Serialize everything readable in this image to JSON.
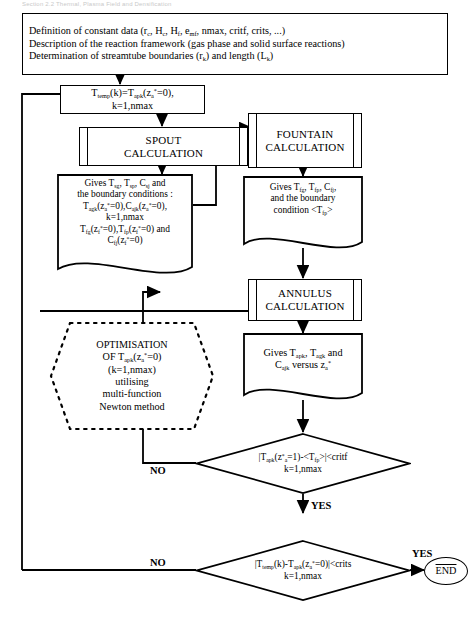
{
  "page": {
    "scan_header": "Section 2.2 Thermal, Plasma Field and Densification",
    "background": "#ffffff",
    "line_color": "#000000"
  },
  "start_box": {
    "lines": [
      "Definition of constant data (r c, H c, H f, e mf, nmax, critf, crits, ...)",
      "Description of the reaction framework (gas phase and solid surface reactions)",
      "Determination of streamtube boundaries (r k) and length (L k)"
    ],
    "line1_a": "Definition of constant data (r",
    "line1_sub1": "c",
    "line1_b": ", H",
    "line1_sub2": "c",
    "line1_c": ", H",
    "line1_sub3": "f",
    "line1_d": ", e",
    "line1_sub4": "mf",
    "line1_e": ", nmax, critf, crits, ...)",
    "line2": "Description of the reaction framework (gas phase and solid surface reactions)",
    "line3_a": "Determination of streamtube boundaries (r",
    "line3_sub1": "k",
    "line3_b": ") and length (L",
    "line3_sub2": "k",
    "line3_c": ")"
  },
  "init_box": {
    "l1_a": "T",
    "l1_sub1": "temp",
    "l1_b": "(k)=T",
    "l1_sub2": "apk",
    "l1_c": "(z",
    "l1_sub3": "a",
    "l1_sup": "*",
    "l1_d": "=0),",
    "l2": "k=1,nmax"
  },
  "spout_proc": {
    "line1": "SPOUT",
    "line2": "CALCULATION"
  },
  "fountain_proc": {
    "line1": "FOUNTAIN",
    "line2": "CALCULATION"
  },
  "annulus_proc": {
    "line1": "ANNULUS",
    "line2": "CALCULATION"
  },
  "spout_out": {
    "l1_a": "Gives T",
    "l1_s1": "sg",
    "l1_b": ", T",
    "l1_s2": "sp",
    "l1_c": ", C",
    "l1_s3": "sj",
    "l1_d": " and",
    "l2": "the boundary conditions :",
    "l3_a": "T",
    "l3_s1": "agk",
    "l3_b": "(z",
    "l3_s2": "a",
    "l3_sup1": "*",
    "l3_c": "=0),C",
    "l3_s3": "ajk",
    "l3_d": "(z",
    "l3_s4": "a",
    "l3_sup2": "*",
    "l3_e": "=0),",
    "l4": "k=1,nmax",
    "l5_a": "T",
    "l5_s1": "fg",
    "l5_b": "(z",
    "l5_s2": "f",
    "l5_sup1": "*",
    "l5_c": "=0),T",
    "l5_s3": "fp",
    "l5_d": "(z",
    "l5_s4": "f",
    "l5_sup2": "*",
    "l5_e": "=0) and",
    "l6_a": "C",
    "l6_s1": "fj",
    "l6_b": "(z",
    "l6_s2": "f",
    "l6_sup": "*",
    "l6_c": "=0)"
  },
  "fountain_out": {
    "l1_a": "Gives T",
    "l1_s1": "fg",
    "l1_b": ", T",
    "l1_s2": "fp",
    "l1_c": ", C",
    "l1_s3": "fj",
    "l1_d": ",",
    "l2": "and  the boundary",
    "l3_a": "condition <T",
    "l3_s1": "fp",
    "l3_b": ">"
  },
  "annulus_out": {
    "l1_a": "Gives T",
    "l1_s1": "apk",
    "l1_b": ", T",
    "l1_s2": "agk",
    "l1_c": " and",
    "l2_a": "C",
    "l2_s1": "ajk",
    "l2_b": " versus z",
    "l2_s2": "a",
    "l2_sup": "*"
  },
  "optimisation": {
    "l1": "OPTIMISATION",
    "l2_a": "OF T",
    "l2_s1": "apk",
    "l2_b": "(z",
    "l2_s2": "a",
    "l2_sup": "*",
    "l2_c": "=0)",
    "l3": "(k=1,nmax)",
    "l4": "utilising",
    "l5": "multi-function",
    "l6": "Newton method"
  },
  "decision_fountain": {
    "l1_a": "|T",
    "l1_s1": "apk",
    "l1_b": "(z",
    "l1_sup": "*",
    "l1_s2": "a",
    "l1_c": "=1)-<T",
    "l1_s3": "fp",
    "l1_d": ">|<critf",
    "l2": "k=1,nmax",
    "no_label": "NO",
    "yes_label": "YES"
  },
  "decision_final": {
    "l1_a": "|T",
    "l1_s1": "temp",
    "l1_b": "(k)-T",
    "l1_s2": "apk",
    "l1_c": "(z",
    "l1_s3": "a",
    "l1_sup": "*",
    "l1_d": "=0)|<crits",
    "l2": "k=1,nmax",
    "no_label": "NO",
    "yes_label": "YES"
  },
  "end_node": {
    "label": "END"
  }
}
